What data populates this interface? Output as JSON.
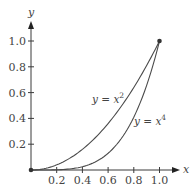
{
  "chart_data": {
    "type": "line",
    "title": "",
    "xlabel": "x",
    "ylabel": "y",
    "xlim": [
      0,
      1.1
    ],
    "ylim": [
      0,
      1.1
    ],
    "grid": false,
    "x_ticks": [
      "0.2",
      "0.4",
      "0.6",
      "0.8",
      "1.0"
    ],
    "y_ticks": [
      "0.2",
      "0.4",
      "0.6",
      "0.8",
      "1.0"
    ],
    "series": [
      {
        "name": "y = x^2",
        "label_base": "y = x",
        "label_exp": "2",
        "function": "x^2",
        "x": [
          0,
          0.2,
          0.4,
          0.6,
          0.8,
          1.0
        ],
        "values": [
          0,
          0.04,
          0.16,
          0.36,
          0.64,
          1.0
        ]
      },
      {
        "name": "y = x^4",
        "label_base": "y = x",
        "label_exp": "4",
        "function": "x^4",
        "x": [
          0,
          0.2,
          0.4,
          0.6,
          0.8,
          1.0
        ],
        "values": [
          0,
          0.0016,
          0.0256,
          0.1296,
          0.4096,
          1.0
        ]
      }
    ],
    "points": [
      {
        "x": 0,
        "y": 0,
        "marker": "filled-dot"
      },
      {
        "x": 1,
        "y": 1,
        "marker": "filled-dot"
      }
    ],
    "legend": "inline labels next to curves",
    "colors": {
      "axis": "#3a3a3a",
      "curve": "#4a4a4a",
      "text": "#444444"
    }
  }
}
